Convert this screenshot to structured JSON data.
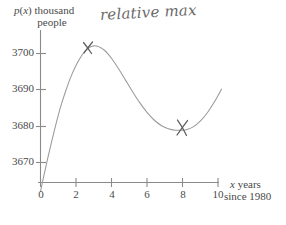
{
  "figure": {
    "background_color": "#ffffff",
    "ink_color": "#7d7d7d",
    "pencil_color": "#5d5d5d",
    "annotation": "relative max"
  },
  "chart_data": {
    "type": "line",
    "title": "",
    "xlabel_line1": "x years",
    "xlabel_line2": "since 1980",
    "ylabel_line1": "p(x) thousand",
    "ylabel_line2": "people",
    "xlim": [
      0,
      10.6
    ],
    "ylim": [
      3662,
      3706
    ],
    "grid": false,
    "legend": "none",
    "xticks": [
      0,
      2,
      4,
      6,
      8,
      10
    ],
    "xtick_labels": [
      "0",
      "2",
      "4",
      "6",
      "8",
      "10"
    ],
    "yticks": [
      3670,
      3680,
      3690,
      3700
    ],
    "ytick_labels": [
      "3670",
      "3680",
      "3690",
      "3700"
    ],
    "series": [
      {
        "name": "p(x)",
        "x": [
          0.0,
          0.2,
          0.4,
          0.6,
          0.8,
          1.0,
          1.2,
          1.4,
          1.6,
          1.8,
          2.0,
          2.2,
          2.4,
          2.6,
          2.8,
          3.0,
          3.2,
          3.4,
          3.6,
          3.8,
          4.0,
          4.4,
          4.8,
          5.2,
          5.6,
          6.0,
          6.4,
          6.8,
          7.2,
          7.6,
          8.0,
          8.2,
          8.6,
          9.0,
          9.4,
          9.8,
          10.2
        ],
        "y": [
          3662.0,
          3666.6,
          3671.0,
          3675.2,
          3679.2,
          3683.0,
          3686.4,
          3689.4,
          3692.2,
          3694.6,
          3696.7,
          3698.5,
          3700.0,
          3701.1,
          3701.8,
          3702.1,
          3702.0,
          3701.6,
          3700.9,
          3699.9,
          3698.7,
          3695.8,
          3692.6,
          3689.4,
          3686.4,
          3683.8,
          3681.7,
          3680.2,
          3679.3,
          3678.9,
          3678.9,
          3679.0,
          3679.8,
          3681.4,
          3683.7,
          3686.7,
          3690.2
        ]
      }
    ],
    "marked_points": [
      {
        "label": "relative max",
        "x": 3.0,
        "y": 3702.1,
        "marker": "x"
      },
      {
        "label": "relative min",
        "x": 8.2,
        "y": 3679.0,
        "marker": "x"
      }
    ]
  },
  "axes": {
    "y_ticks": [
      {
        "label": "3700",
        "value": 3700
      },
      {
        "label": "3690",
        "value": 3690
      },
      {
        "label": "3680",
        "value": 3680
      },
      {
        "label": "3670",
        "value": 3670
      }
    ],
    "x_ticks": [
      {
        "label": "0",
        "value": 0
      },
      {
        "label": "2",
        "value": 2
      },
      {
        "label": "4",
        "value": 4
      },
      {
        "label": "6",
        "value": 6
      },
      {
        "label": "8",
        "value": 8
      },
      {
        "label": "10",
        "value": 10
      }
    ]
  }
}
